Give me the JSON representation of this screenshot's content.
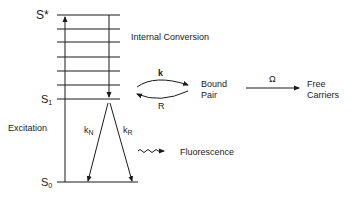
{
  "diagram": {
    "type": "energy-level-diagram",
    "levels": {
      "top": "S*",
      "s1_letter": "S",
      "s1_sub": "1",
      "s0_letter": "S",
      "s0_sub": "0"
    },
    "labels": {
      "internal_conversion": "Internal Conversion",
      "excitation": "Excitation",
      "fluorescence": "Fluorescence",
      "bound_pair_line1": "Bound",
      "bound_pair_line2": "Pair",
      "free_carriers_line1": "Free",
      "free_carriers_line2": "Carriers"
    },
    "rates": {
      "k": "k",
      "R": "R",
      "omega": "Ω",
      "kN_main": "k",
      "kN_sub": "N",
      "kR_main": "k",
      "kR_sub": "R"
    },
    "color": "#1a1a1a"
  }
}
